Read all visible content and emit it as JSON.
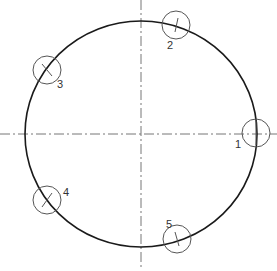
{
  "diagram": {
    "type": "bolt-circle / points on circle",
    "main_circle": {
      "cx": 141,
      "cy": 134,
      "rx": 116,
      "ry": 113,
      "stroke": "#1a1a1a"
    },
    "centerlines": {
      "horizontal": {
        "y": 134,
        "x1": 0,
        "x2": 277
      },
      "vertical": {
        "x": 141,
        "y1": 0,
        "y2": 268
      },
      "stroke": "#777777"
    },
    "points": [
      {
        "label": "1",
        "cx": 256,
        "cy": 133,
        "r": 14,
        "tick": [
          256,
          121,
          256,
          145
        ],
        "lx": 235,
        "ly": 148
      },
      {
        "label": "2",
        "cx": 176,
        "cy": 25,
        "r": 14,
        "tick": [
          178,
          18,
          175,
          32
        ],
        "lx": 167,
        "ly": 49
      },
      {
        "label": "3",
        "cx": 47,
        "cy": 70,
        "r": 14,
        "tick": [
          42,
          64,
          52,
          76
        ],
        "lx": 57,
        "ly": 88
      },
      {
        "label": "4",
        "cx": 47,
        "cy": 200,
        "r": 14,
        "tick": [
          52,
          193,
          42,
          207
        ],
        "lx": 63,
        "ly": 196
      },
      {
        "label": "5",
        "cx": 177,
        "cy": 239,
        "r": 14,
        "tick": [
          175,
          232,
          179,
          246
        ],
        "lx": 166,
        "ly": 228
      }
    ]
  }
}
